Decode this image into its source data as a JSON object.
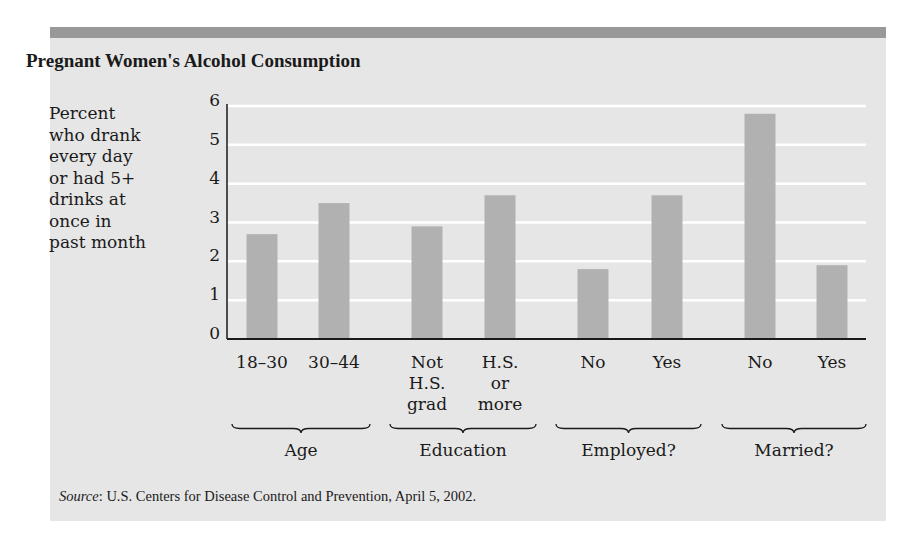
{
  "title": "Pregnant Women's Alcohol Consumption",
  "ylabel_lines": [
    "Percent",
    "who drank",
    "every day",
    "or had 5+",
    "drinks at",
    "once in",
    "past month"
  ],
  "source": {
    "label": "Source",
    "text": ": U.S. Centers for Disease Control and Prevention, April 5, 2002."
  },
  "colors": {
    "panel": "#e6e6e6",
    "topbar": "#999999",
    "bar": "#b1b1b1",
    "gridline": "#ffffff",
    "axis": "#1a1a1a"
  },
  "chart_data": {
    "type": "bar",
    "title": "Pregnant Women's Alcohol Consumption",
    "xlabel": "",
    "ylabel": "Percent who drank every day or had 5+ drinks at once in past month",
    "ylim": [
      0,
      6
    ],
    "yticks": [
      "0",
      "1",
      "2",
      "3",
      "4",
      "5",
      "6"
    ],
    "grid": true,
    "legend": "none",
    "categories": [
      "18–30",
      "30–44",
      "Not H.S. grad",
      "H.S. or more",
      "No",
      "Yes",
      "No",
      "Yes"
    ],
    "category_lines": [
      [
        "18–30"
      ],
      [
        "30–44"
      ],
      [
        "Not",
        "H.S.",
        "grad"
      ],
      [
        "H.S.",
        "or",
        "more"
      ],
      [
        "No"
      ],
      [
        "Yes"
      ],
      [
        "No"
      ],
      [
        "Yes"
      ]
    ],
    "values": [
      2.7,
      3.5,
      2.9,
      3.7,
      1.8,
      3.7,
      5.8,
      1.9
    ],
    "groups": [
      {
        "name": "Age",
        "categories": [
          "18–30",
          "30–44"
        ]
      },
      {
        "name": "Education",
        "categories": [
          "Not H.S. grad",
          "H.S. or more"
        ]
      },
      {
        "name": "Employed?",
        "categories": [
          "No",
          "Yes"
        ]
      },
      {
        "name": "Married?",
        "categories": [
          "No",
          "Yes"
        ]
      }
    ],
    "annotation": "Source: U.S. Centers for Disease Control and Prevention, April 5, 2002."
  }
}
